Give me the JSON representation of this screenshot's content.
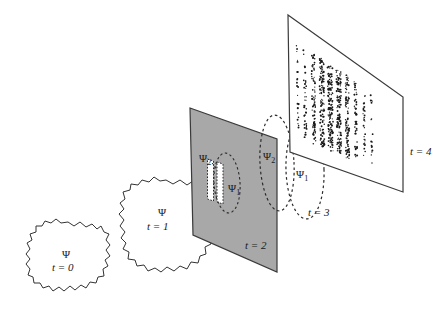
{
  "figure": {
    "background_color": "#ffffff",
    "line_color": "#333333",
    "barrier_fill_color": "#a8a8a8",
    "dot_color": "#1a1a1a",
    "width": 448,
    "height": 310
  },
  "stages": [
    {
      "id": "t0",
      "kind": "wavepacket-blob",
      "psi_label": "Ψ",
      "psi_subscript": "",
      "time_label": "t = 0",
      "time_var": "t",
      "time_eq": " = ",
      "time_value": "0",
      "psi_x": 66,
      "psi_y": 255,
      "time_x": 55,
      "time_y": 268
    },
    {
      "id": "t1",
      "kind": "wavepacket-blob",
      "psi_label": "Ψ",
      "psi_subscript": "",
      "time_label": "t = 1",
      "time_var": "t",
      "time_eq": " = ",
      "time_value": "1",
      "psi_x": 161,
      "psi_y": 213,
      "time_x": 150,
      "time_y": 228
    },
    {
      "id": "t2",
      "kind": "barrier-with-slits",
      "time_label": "t = 2",
      "time_var": "t",
      "time_eq": " = ",
      "time_value": "2",
      "time_x": 248,
      "time_y": 246,
      "slit_count": 2,
      "slit_labels": [
        "Ψ₁",
        "Ψ₂"
      ],
      "psi1_label": "Ψ",
      "psi1_sub": "1",
      "psi1_x": 233,
      "psi1_y": 188,
      "psi2_label": "Ψ",
      "psi2_sub": "2",
      "psi2_x": 205,
      "psi2_y": 159
    },
    {
      "id": "t3",
      "kind": "dashed-wave-lobes",
      "time_label": "t = 3",
      "time_var": "t",
      "time_eq": " = ",
      "time_value": "3",
      "time_x": 311,
      "time_y": 213,
      "psi1_label": "Ψ",
      "psi1_sub": "1",
      "psi1_x": 301,
      "psi1_y": 175,
      "psi2_label": "Ψ",
      "psi2_sub": "2",
      "psi2_x": 269,
      "psi2_y": 157
    },
    {
      "id": "t4",
      "kind": "detection-screen",
      "time_label": "t = 4",
      "time_var": "t",
      "time_eq": " = ",
      "time_value": "4",
      "time_x": 412,
      "time_y": 152,
      "pattern": "interference-fringes"
    }
  ],
  "chart_data": {
    "type": "scatter",
    "xlabel": "",
    "ylabel": "",
    "fringe_bands": [
      {
        "index": 0,
        "rel_x": 0.04,
        "density": 0.1
      },
      {
        "index": 1,
        "rel_x": 0.13,
        "density": 0.26
      },
      {
        "index": 2,
        "rel_x": 0.23,
        "density": 0.55
      },
      {
        "index": 3,
        "rel_x": 0.33,
        "density": 0.85
      },
      {
        "index": 4,
        "rel_x": 0.43,
        "density": 1.0
      },
      {
        "index": 5,
        "rel_x": 0.53,
        "density": 0.92
      },
      {
        "index": 6,
        "rel_x": 0.63,
        "density": 0.62
      },
      {
        "index": 7,
        "rel_x": 0.73,
        "density": 0.32
      },
      {
        "index": 8,
        "rel_x": 0.83,
        "density": 0.16
      },
      {
        "index": 9,
        "rel_x": 0.92,
        "density": 0.07
      }
    ]
  },
  "geometry": {
    "barrier_quad": [
      [
        190,
        108
      ],
      [
        277,
        139
      ],
      [
        277,
        272
      ],
      [
        193,
        235
      ]
    ],
    "screen_quad": [
      [
        288,
        15
      ],
      [
        403,
        97
      ],
      [
        403,
        192
      ],
      [
        290,
        152
      ]
    ],
    "slit_left": {
      "x": 208,
      "y_top": 160,
      "w": 6,
      "h": 40
    },
    "slit_right": {
      "x": 217,
      "y_top": 162,
      "w": 6,
      "h": 40
    }
  }
}
